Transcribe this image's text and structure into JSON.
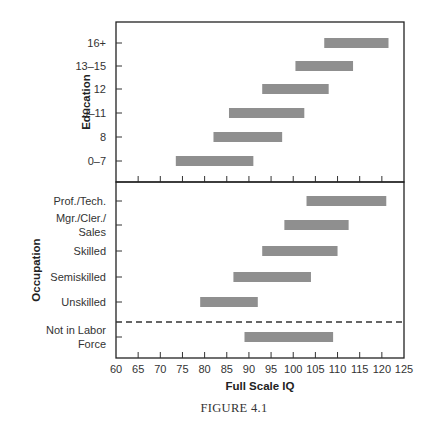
{
  "chart_data": {
    "type": "bar",
    "subtype": "horizontal range (floating bar) chart",
    "caption": "FIGURE 4.1",
    "xlabel": "Full Scale IQ",
    "xlim": [
      60,
      125
    ],
    "xticks": [
      60,
      65,
      70,
      75,
      80,
      85,
      90,
      95,
      100,
      105,
      110,
      115,
      120,
      125
    ],
    "grid": false,
    "legend": null,
    "panels": [
      {
        "ylabel": "Education",
        "categories": [
          "16+",
          "13–15",
          "12",
          "9–11",
          "8",
          "0–7"
        ],
        "ranges": [
          {
            "category": "16+",
            "low": 107,
            "high": 121.5
          },
          {
            "category": "13–15",
            "low": 100.5,
            "high": 113.5
          },
          {
            "category": "12",
            "low": 93,
            "high": 108
          },
          {
            "category": "9–11",
            "low": 85.5,
            "high": 102.5
          },
          {
            "category": "8",
            "low": 82,
            "high": 97.5
          },
          {
            "category": "0–7",
            "low": 73.5,
            "high": 91
          }
        ]
      },
      {
        "ylabel": "Occupation",
        "categories": [
          "Prof./Tech.",
          "Mgr./Cler./ Sales",
          "Skilled",
          "Semiskilled",
          "Unskilled",
          "Not in Labor Force"
        ],
        "ranges": [
          {
            "category": "Prof./Tech.",
            "low": 103,
            "high": 121
          },
          {
            "category": "Mgr./Cler./ Sales",
            "low": 98,
            "high": 112.5
          },
          {
            "category": "Skilled",
            "low": 93,
            "high": 110
          },
          {
            "category": "Semiskilled",
            "low": 86.5,
            "high": 104
          },
          {
            "category": "Unskilled",
            "low": 79,
            "high": 92
          },
          {
            "category": "Not in Labor Force",
            "low": 89,
            "high": 109
          }
        ],
        "separator": "dashed line between Unskilled and Not in Labor Force"
      }
    ]
  },
  "colors": {
    "bar": "#8f8f8f",
    "axis": "#222222"
  },
  "labels": {
    "education_title": "Education",
    "occupation_title": "Occupation",
    "x_title": "Full Scale IQ",
    "caption": "FIGURE 4.1",
    "edu": [
      "16+",
      "13–15",
      "12",
      "9–11",
      "8",
      "0–7"
    ],
    "occ": [
      {
        "lines": [
          "Prof./Tech."
        ]
      },
      {
        "lines": [
          "Mgr./Cler./",
          "Sales"
        ]
      },
      {
        "lines": [
          "Skilled"
        ]
      },
      {
        "lines": [
          "Semiskilled"
        ]
      },
      {
        "lines": [
          "Unskilled"
        ]
      },
      {
        "lines": [
          "Not in Labor",
          "Force"
        ]
      }
    ]
  }
}
